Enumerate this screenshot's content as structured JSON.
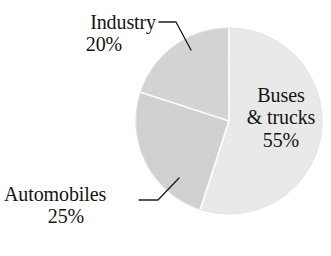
{
  "chart_data": {
    "type": "pie",
    "title": "",
    "subtitle": "",
    "xlabel": "",
    "ylabel": "",
    "legend_position": "none",
    "grid": false,
    "categories": [
      "Buses & trucks",
      "Automobiles",
      "Industry"
    ],
    "values": [
      55,
      25,
      20
    ],
    "unit": "%",
    "slices": [
      {
        "label": "Buses & trucks",
        "label_line1": "Buses",
        "label_line2": "& trucks",
        "value": 55,
        "value_text": "55%",
        "color": "#ececec",
        "label_placement": "inside",
        "start_angle_deg": 0,
        "end_angle_deg": 198
      },
      {
        "label": "Automobiles",
        "label_line1": "Automobiles",
        "value": 25,
        "value_text": "25%",
        "color": "#d2d2d2",
        "label_placement": "outside-left-bottom",
        "start_angle_deg": 198,
        "end_angle_deg": 288
      },
      {
        "label": "Industry",
        "label_line1": "Industry",
        "value": 20,
        "value_text": "20%",
        "color": "#d5d5d5",
        "label_placement": "outside-left-top",
        "start_angle_deg": 288,
        "end_angle_deg": 360
      }
    ],
    "total": 100,
    "background_color": "#ffffff",
    "text_color": "#141414",
    "divider_color": "#ffffff",
    "outline_color": "#e2e2e2",
    "leader_line_color": "#1f1f1f"
  },
  "labels": {
    "industry": {
      "name": "Industry",
      "pct": "20%"
    },
    "automobiles": {
      "name": "Automobiles",
      "pct": "25%"
    },
    "buses": {
      "line1": "Buses",
      "line2": "& trucks",
      "pct": "55%"
    }
  }
}
